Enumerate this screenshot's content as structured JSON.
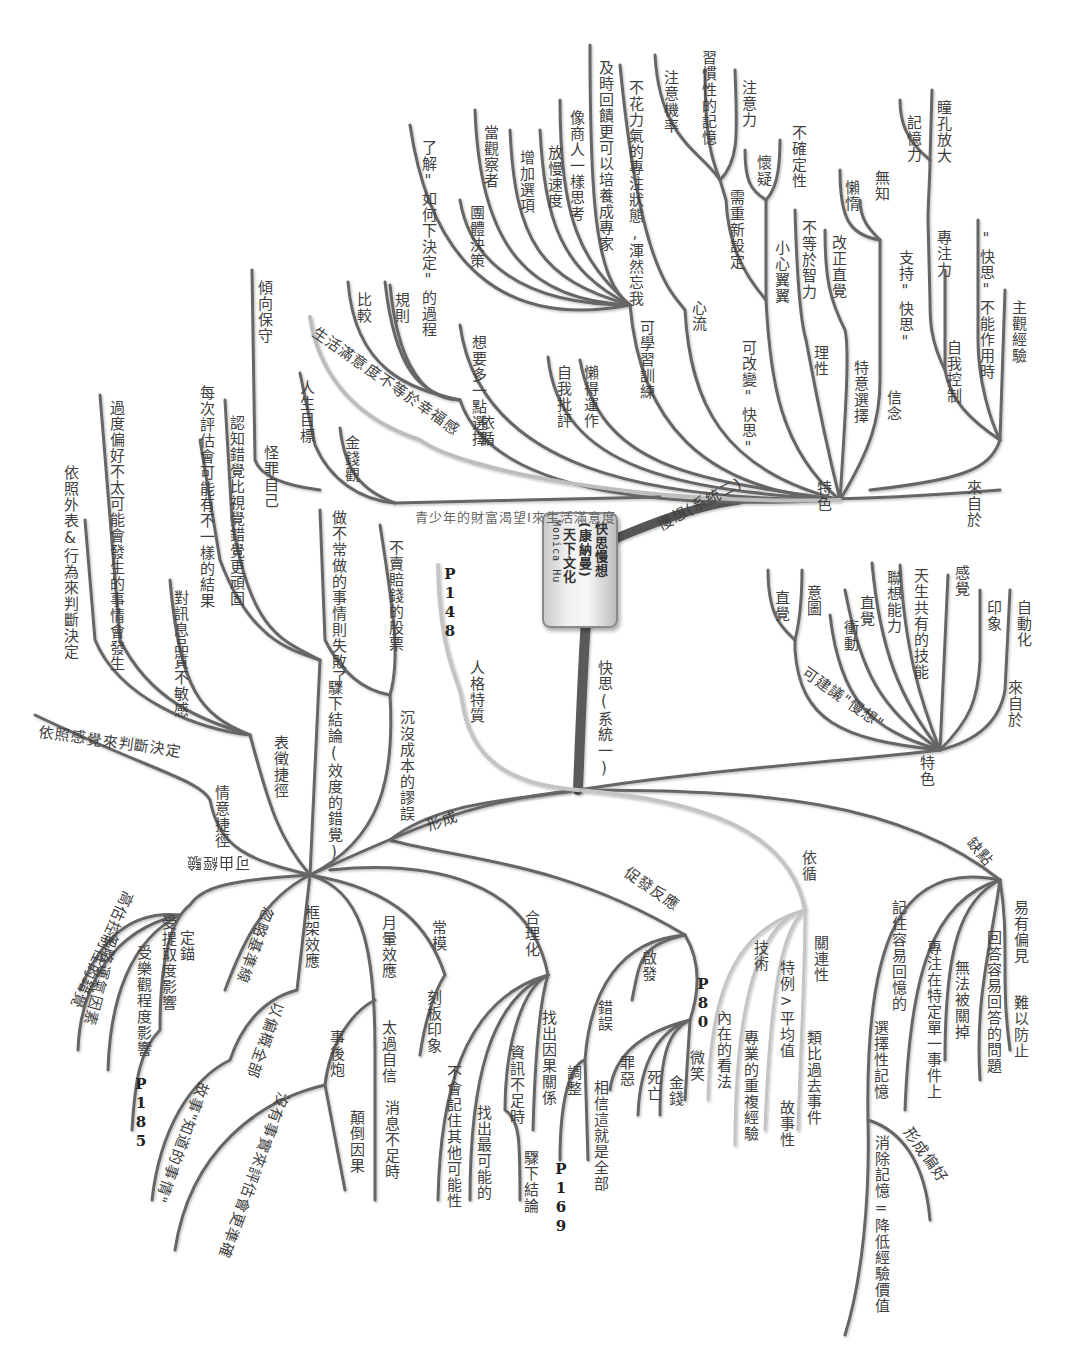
{
  "central_node": {
    "title": "快思慢想",
    "author": "(康納曼)",
    "publisher": "天下文化",
    "credit": "Monica Hu"
  },
  "colors": {
    "branch_dark": "#555555",
    "branch_mid": "#7a7a7a",
    "branch_light": "#c4c4c4",
    "text": "#3f3f3f",
    "background": "#ffffff"
  },
  "branches": {
    "slow_system": {
      "label": "慢想(系統二)",
      "top_trait_label": "特色",
      "top_trait_children": [
        "主觀經驗",
        "\"快思\"不能作用時",
        "自我控制",
        "專注力",
        "瞳孔放大",
        "記憶力",
        "信念",
        "支持\"快思\"",
        "無知",
        "懶惰",
        "特意選擇",
        "改正直覺",
        "理性",
        "不等於智力",
        "小心翼翼",
        "不確定性",
        "懷疑",
        "可改變\"快思\"",
        "需重新設定",
        "習慣性的記憶",
        "注意力",
        "注意機率",
        "心流",
        "不花力氣的專注狀態,渾然忘我",
        "可學習訓練",
        "及時回饋更可以培養成專家",
        "像商人一樣思考",
        "放慢速度",
        "增加選項",
        "當觀察者",
        "團體決策",
        "了解\"如何下決定\"的過程",
        "懶得運作",
        "自我批評",
        "想要多一點選擇",
        "依循",
        "規則",
        "比較",
        "生活滿意度不等於幸福感",
        "青少年的財富渴望I來生活滿意度",
        "傾向保守",
        "怪罪自己",
        "人生目標",
        "金錢觀"
      ],
      "mid_label": "來自於"
    },
    "fast_system": {
      "label": "快思(系統一)",
      "traits_label": "特色",
      "traits": [
        "自動化",
        "印象",
        "感覺",
        "天生共有的技能",
        "聯想能力",
        "直覺",
        "衝動",
        "可建議\"慢想\"",
        "意圖",
        "直覺",
        "來自於"
      ],
      "weakness_label": "缺點",
      "weaknesses": [
        "易有偏見",
        "難以防止",
        "回答容易回答的問題",
        "無法被關掉",
        "專注在特定單一事件上",
        "記住容易回憶的",
        "選擇性記憶",
        "形成偏好",
        "消除記憶=降低經驗價值"
      ],
      "follow_label": "依循",
      "follow_children": [
        "關連性",
        "類比過去事件",
        "特例>平均值",
        "故事性",
        "技術",
        "專業的重複經驗",
        "內在的看法"
      ],
      "reaction_label": "促發反應",
      "reaction_children": [
        "啟發",
        "P80",
        "微笑",
        "金錢",
        "死亡",
        "罪惡",
        "錯誤",
        "相信這就是全部",
        "調整"
      ],
      "rationalize_label": "合理化",
      "rationalize_children": [
        "找出因果關係",
        "資訊不足時",
        "驟下結論",
        "P169",
        "找出最可能的",
        "不會記住其他可能性"
      ],
      "personality_label": "人格特質",
      "personality_page": "P148",
      "form_label": "形成",
      "form_children": [
        "常模",
        "刻板印象",
        "月暈效應",
        "太過自信",
        "消息不足時",
        "事後炮",
        "顛倒因果",
        "沒有事實來評估會更準確",
        "框架效應",
        "忽略基準線",
        "以偏概全部",
        "故事\"知道的事情\"",
        "可由經驗",
        "定錨",
        "高估控制性的錯覺",
        "忽略運氣因素",
        "受樂觀程度影響",
        "受提取度影響",
        "P185",
        "情意捷徑",
        "依照感覺來判斷決定",
        "表徵捷徑",
        "對訊息品質不敏感",
        "過度偏好不太可能會發生的事情會發生",
        "依照外表&行為來判斷決定",
        "驟下結論(效度的錯覺)",
        "認知錯覺比視覺錯覺更頑固",
        "每次評估會可能有不一樣的結果",
        "沉沒成本的謬誤",
        "做不常做的事情則失敗了",
        "不賣賠錢的股票"
      ]
    }
  }
}
